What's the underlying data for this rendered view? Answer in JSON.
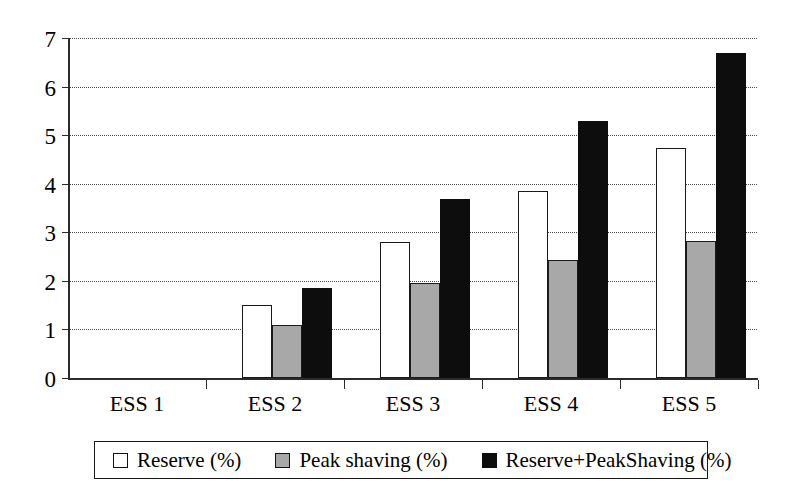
{
  "chart_data": {
    "type": "bar",
    "title": "",
    "subtitle": "",
    "xlabel": "",
    "ylabel": "",
    "categories": [
      "ESS 1",
      "ESS 2",
      "ESS 3",
      "ESS 4",
      "ESS 5"
    ],
    "series": [
      {
        "name": "Reserve (%)",
        "color": "#ffffff",
        "values": [
          0,
          1.5,
          2.8,
          3.85,
          4.73
        ]
      },
      {
        "name": "Peak shaving (%)",
        "color": "#a8a8a8",
        "values": [
          0,
          1.1,
          1.95,
          2.42,
          2.82
        ]
      },
      {
        "name": "Reserve+PeakShaving (%)",
        "color": "#0d0d0d",
        "values": [
          0,
          1.85,
          3.68,
          5.3,
          6.7
        ]
      }
    ],
    "ylim": [
      0,
      7
    ],
    "ytick_labels": [
      "0",
      "1",
      "2",
      "3",
      "4",
      "5",
      "6",
      "7"
    ],
    "ytick_values": [
      0,
      1,
      2,
      3,
      4,
      5,
      6,
      7
    ],
    "grid": true,
    "grid_style": "dotted",
    "legend_position": "bottom",
    "annotations": []
  },
  "legend": {
    "items": [
      {
        "label": "Reserve (%)",
        "swatch": "white-square-icon"
      },
      {
        "label": "Peak shaving (%)",
        "swatch": "gray-square-icon"
      },
      {
        "label": "Reserve+PeakShaving (%)",
        "swatch": "black-square-icon"
      }
    ]
  }
}
